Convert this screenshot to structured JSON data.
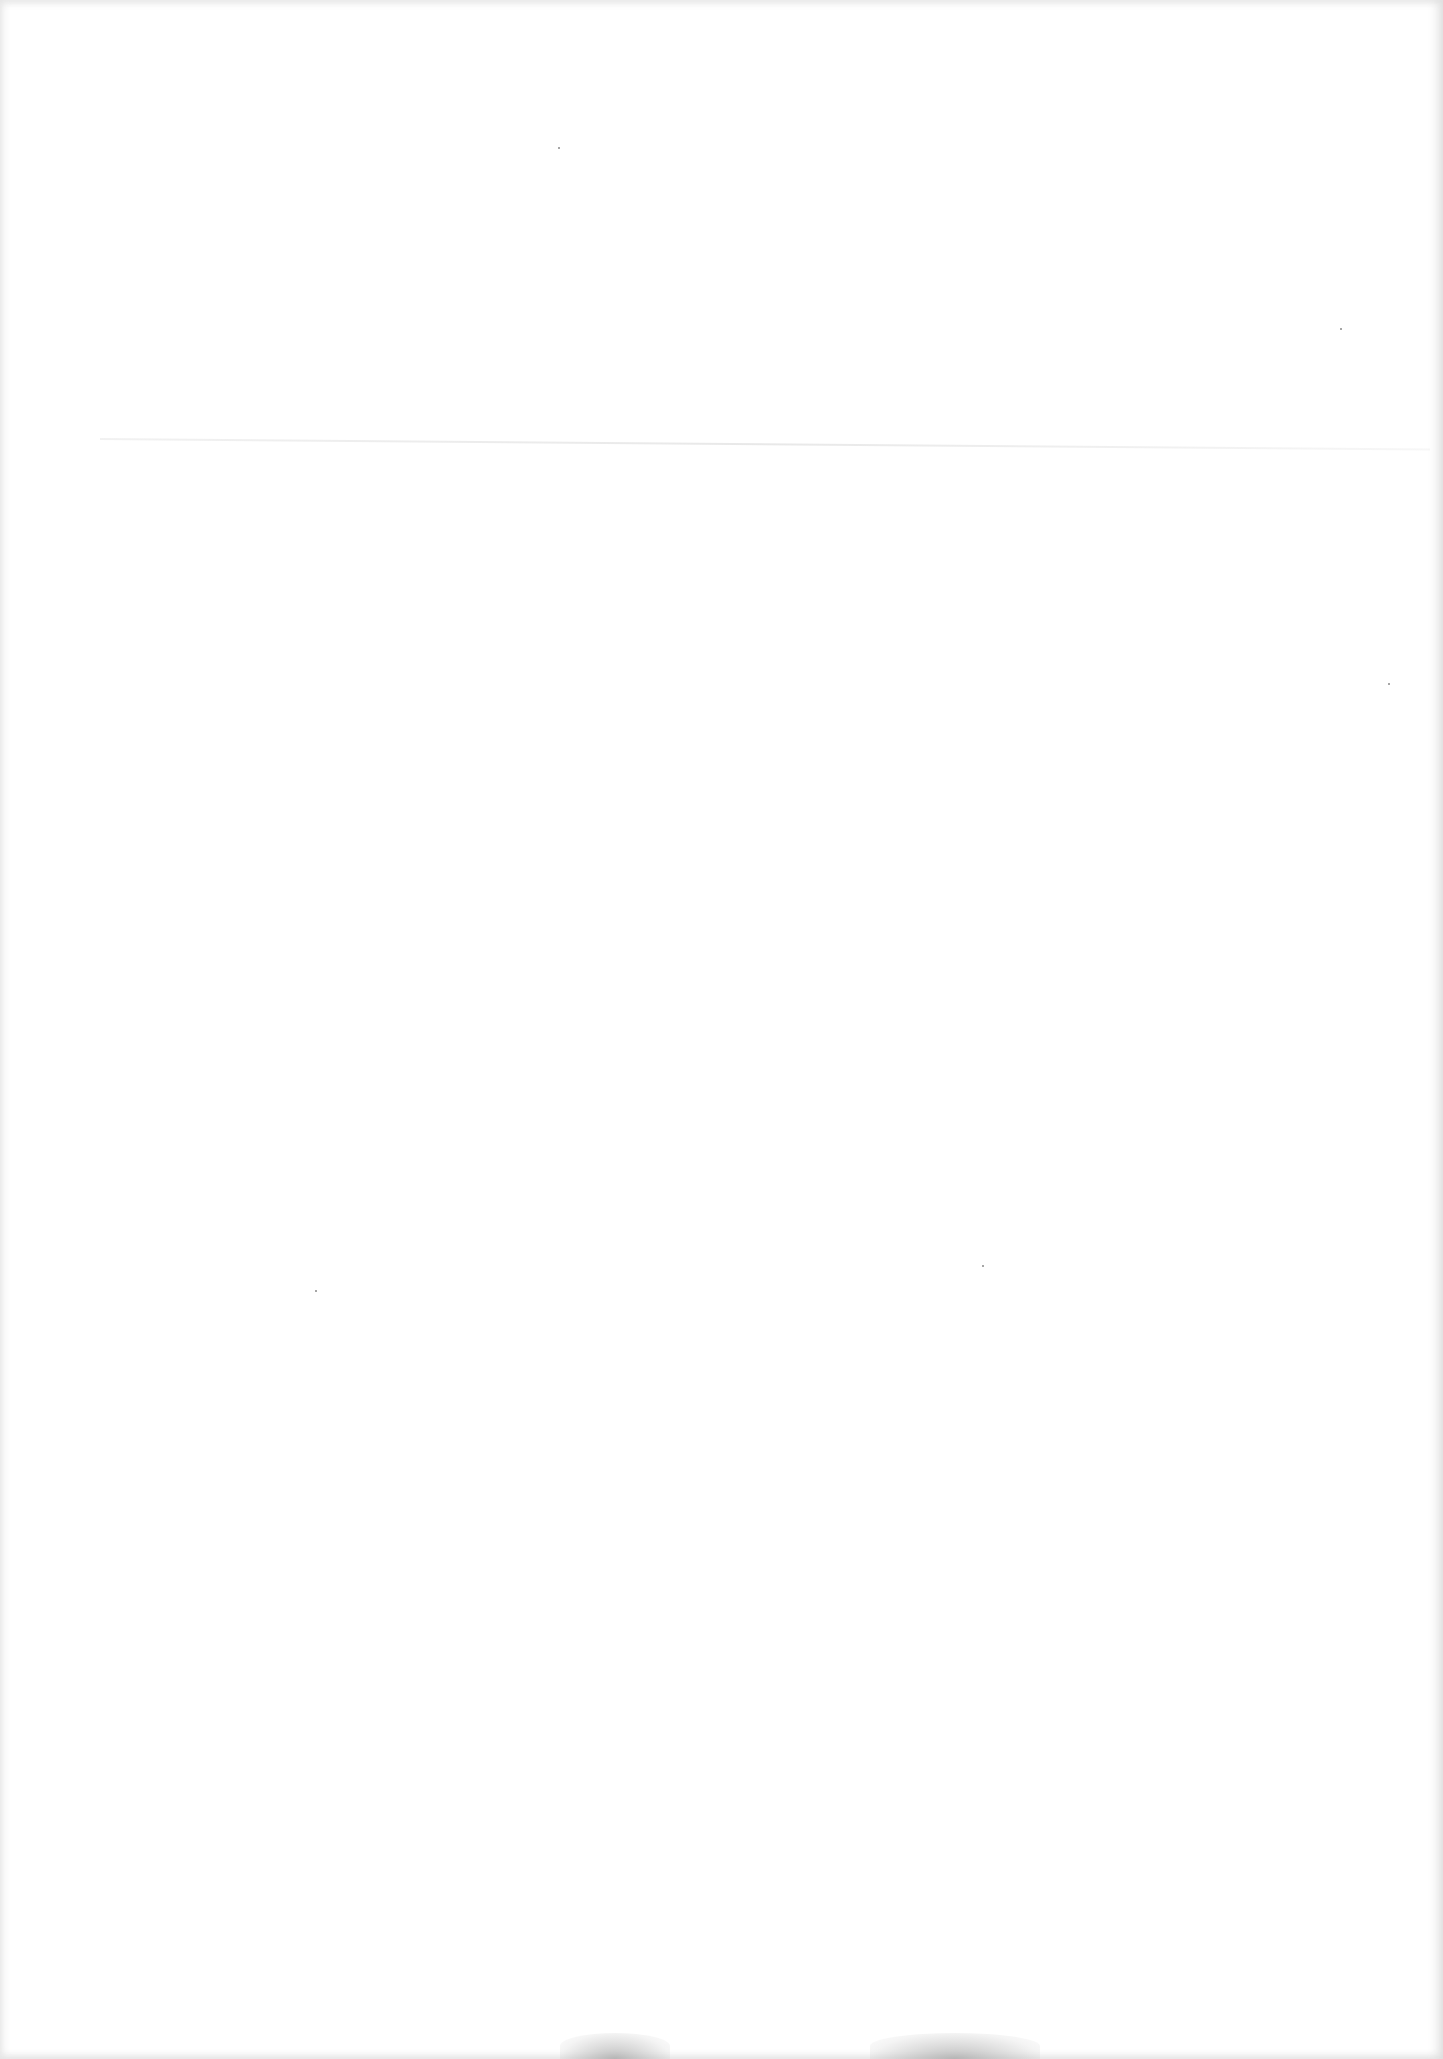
{
  "document": {
    "type": "scanned-page",
    "content": "",
    "background_color": "#ffffff",
    "artifacts": {
      "show_through_line": true,
      "specks": [
        {
          "x": 558,
          "y": 147
        },
        {
          "x": 1340,
          "y": 328
        },
        {
          "x": 315,
          "y": 1290
        },
        {
          "x": 982,
          "y": 1265
        },
        {
          "x": 1388,
          "y": 683
        }
      ],
      "smudges": [
        {
          "x": 560,
          "width": 110
        },
        {
          "x": 870,
          "width": 170
        }
      ]
    }
  }
}
